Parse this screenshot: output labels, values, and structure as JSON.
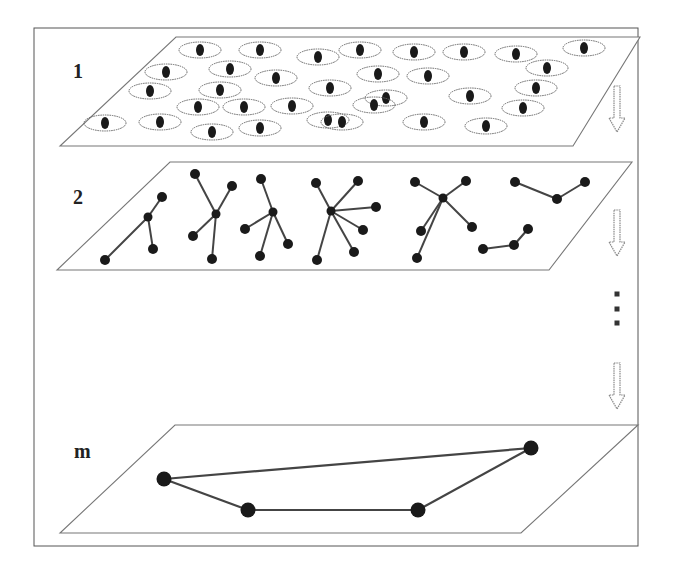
{
  "figure": {
    "frame": {
      "x": 34,
      "y": 28,
      "w": 278,
      "h": 518
    },
    "colors": {
      "ink": "#1a1a1a",
      "line": "#444444",
      "frame": "#555555",
      "ellipse": "#666666"
    },
    "layers": [
      {
        "label": "1",
        "label_pos": {
          "x": 75,
          "y": 68
        },
        "plane": [
          [
            176,
            37
          ],
          [
            640,
            37
          ],
          [
            573,
            146
          ],
          [
            60,
            146
          ]
        ],
        "clusters": [
          [
            200,
            50
          ],
          [
            260,
            50
          ],
          [
            318,
            57
          ],
          [
            360,
            50
          ],
          [
            414,
            52
          ],
          [
            464,
            52
          ],
          [
            516,
            54
          ],
          [
            584,
            48
          ],
          [
            166,
            72
          ],
          [
            230,
            69
          ],
          [
            276,
            78
          ],
          [
            378,
            74
          ],
          [
            428,
            76
          ],
          [
            547,
            68
          ],
          [
            150,
            91
          ],
          [
            220,
            90
          ],
          [
            330,
            88
          ],
          [
            386,
            98
          ],
          [
            470,
            96
          ],
          [
            536,
            88
          ],
          [
            198,
            107
          ],
          [
            244,
            107
          ],
          [
            292,
            106
          ],
          [
            374,
            105
          ],
          [
            523,
            108
          ],
          [
            105,
            123
          ],
          [
            160,
            122
          ],
          [
            212,
            132
          ],
          [
            260,
            128
          ],
          [
            328,
            120
          ],
          [
            342,
            122
          ],
          [
            424,
            122
          ],
          [
            486,
            126
          ]
        ]
      },
      {
        "label": "2",
        "label_pos": {
          "x": 75,
          "y": 190
        },
        "plane": [
          [
            170,
            162
          ],
          [
            632,
            162
          ],
          [
            549,
            270
          ],
          [
            57,
            270
          ]
        ],
        "trees": [
          {
            "hub": [
              148,
              217
            ],
            "leaves": [
              [
                162,
                197
              ],
              [
                105,
                260
              ],
              [
                153,
                249
              ]
            ]
          },
          {
            "hub": [
              216,
              214
            ],
            "leaves": [
              [
                195,
                174
              ],
              [
                232,
                186
              ],
              [
                193,
                236
              ],
              [
                212,
                259
              ]
            ]
          },
          {
            "hub": [
              273,
              212
            ],
            "leaves": [
              [
                261,
                179
              ],
              [
                245,
                229
              ],
              [
                260,
                256
              ],
              [
                288,
                244
              ]
            ]
          },
          {
            "hub": [
              331,
              211
            ],
            "leaves": [
              [
                316,
                183
              ],
              [
                358,
                181
              ],
              [
                376,
                207
              ],
              [
                363,
                230
              ],
              [
                354,
                252
              ],
              [
                317,
                260
              ]
            ]
          },
          {
            "hub": [
              443,
              198
            ],
            "leaves": [
              [
                415,
                182
              ],
              [
                466,
                181
              ],
              [
                472,
                227
              ],
              [
                421,
                231
              ],
              [
                417,
                258
              ]
            ]
          },
          {
            "chain": [
              [
                515,
                182
              ],
              [
                557,
                199
              ],
              [
                585,
                182
              ]
            ]
          },
          {
            "chain": [
              [
                483,
                249
              ],
              [
                514,
                245
              ],
              [
                528,
                229
              ]
            ]
          }
        ]
      },
      {
        "label": "m",
        "label_pos": {
          "x": 76,
          "y": 452
        },
        "plane": [
          [
            175,
            425
          ],
          [
            638,
            425
          ],
          [
            521,
            533
          ],
          [
            60,
            533
          ]
        ],
        "network": {
          "nodes": [
            [
              164,
              479
            ],
            [
              248,
              510
            ],
            [
              418,
              510
            ],
            [
              531,
              448
            ]
          ],
          "edges": [
            [
              0,
              1
            ],
            [
              1,
              2
            ],
            [
              2,
              3
            ],
            [
              3,
              0
            ]
          ]
        }
      }
    ],
    "arrows": [
      {
        "x": 617,
        "y": 86,
        "h": 46
      },
      {
        "x": 617,
        "y": 210,
        "h": 46
      },
      {
        "x": 617,
        "y": 363,
        "h": 46
      }
    ],
    "ellipsis": {
      "x": 617,
      "ys": [
        294,
        309,
        323
      ],
      "symbol": "..."
    }
  }
}
